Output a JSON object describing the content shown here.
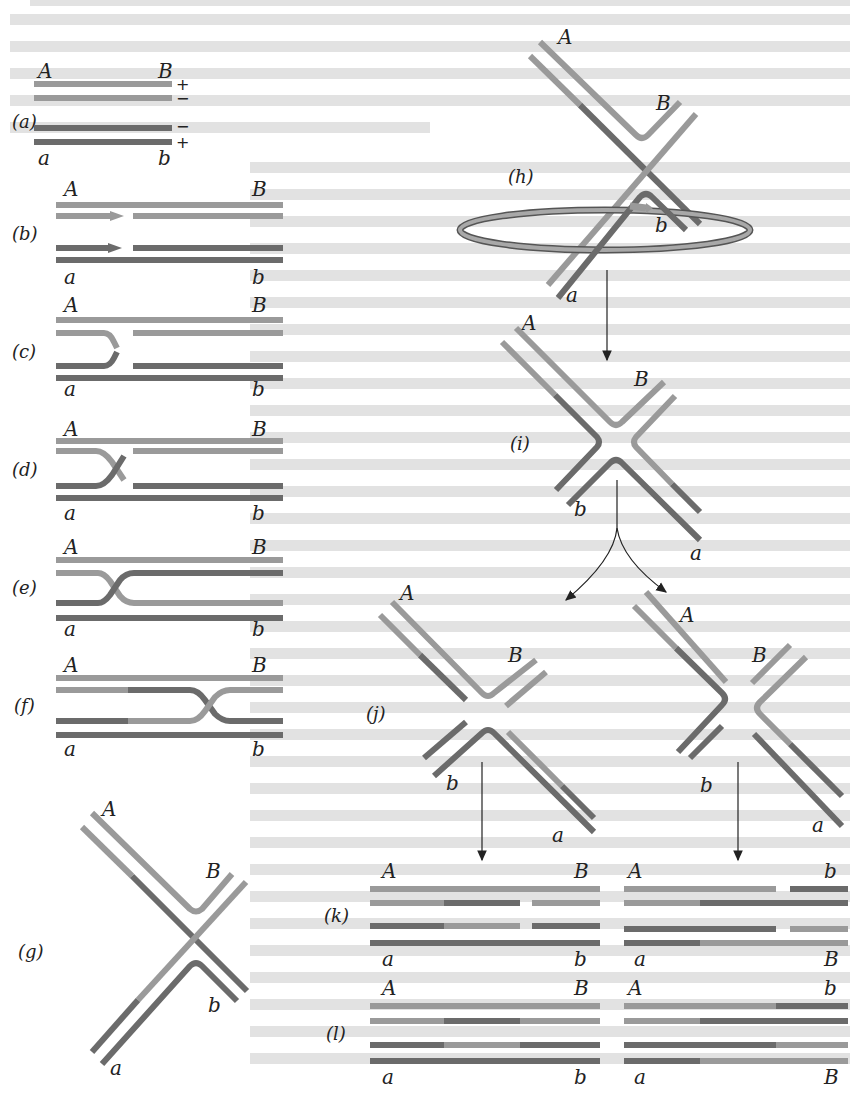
{
  "figure": {
    "colors": {
      "light_strand": "#9a9a9a",
      "dark_strand": "#6b6b6b",
      "text": "#222222",
      "background_bleed": "#dcdcdc"
    },
    "marker_labels": {
      "upper_left": "A",
      "upper_right": "B",
      "lower_left": "a",
      "lower_right": "b"
    },
    "strand_polarity": {
      "top1": "+",
      "top2": "−",
      "bot1": "−",
      "bot2": "+"
    },
    "panels": [
      {
        "id": "a",
        "label": "(a)"
      },
      {
        "id": "b",
        "label": "(b)"
      },
      {
        "id": "c",
        "label": "(c)"
      },
      {
        "id": "d",
        "label": "(d)"
      },
      {
        "id": "e",
        "label": "(e)"
      },
      {
        "id": "f",
        "label": "(f)"
      },
      {
        "id": "g",
        "label": "(g)"
      },
      {
        "id": "h",
        "label": "(h)"
      },
      {
        "id": "i",
        "label": "(i)"
      },
      {
        "id": "j",
        "label": "(j)"
      },
      {
        "id": "k",
        "label": "(k)"
      },
      {
        "id": "l",
        "label": "(l)"
      }
    ],
    "products": {
      "k_left": {
        "top_left": "A",
        "top_right": "B",
        "bottom_left": "a",
        "bottom_right": "b"
      },
      "k_right": {
        "top_left": "A",
        "top_right": "b",
        "bottom_left": "a",
        "bottom_right": "B"
      },
      "l_left": {
        "top_left": "A",
        "top_right": "B",
        "bottom_left": "a",
        "bottom_right": "b"
      },
      "l_right": {
        "top_left": "A",
        "top_right": "b",
        "bottom_left": "a",
        "bottom_right": "B"
      }
    }
  }
}
